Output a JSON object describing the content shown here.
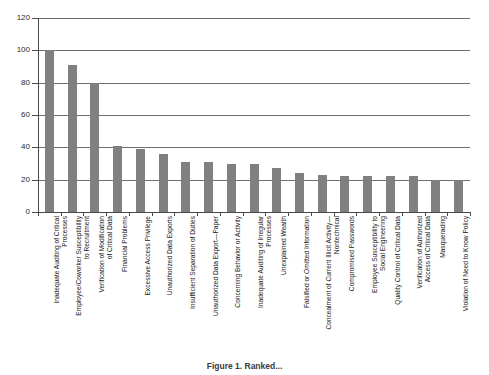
{
  "figure": {
    "caption": "Figure 1. Ranked...",
    "background_color": "#ffffff",
    "bar_color": "#808080",
    "axis_color": "#4a4a4a",
    "grid_color": "#6e6e6e"
  },
  "chart_data": {
    "type": "bar",
    "title": "",
    "subtitle": "",
    "xlabel": "",
    "ylabel": "",
    "ylim": [
      0,
      120
    ],
    "yticks": [
      0,
      20,
      40,
      60,
      80,
      100,
      120
    ],
    "ytick_labels": [
      "0",
      "20",
      "40",
      "60",
      "80",
      "100",
      "120"
    ],
    "grid": true,
    "grid_axis": "y",
    "legend": false,
    "legend_position": "none",
    "orientation": "vertical",
    "categories": [
      "Inadequate Auditing of Critical\nProcesses",
      "Employee/Coworker Susceptibility\nto Recruitment",
      "Verification of Modification\nof Critical Data",
      "Financial Problems",
      "Excessive Access Privilege",
      "Unauthorized Data Exports",
      "Insufficient Separation of Duties",
      "Unauthorized Data Export—Paper",
      "Concerning Behavior or Activity",
      "Inadequate Auditing of Irregular\nProcesses",
      "Unexplained Wealth",
      "Falsified or Omitted Information",
      "Concealment of Current Illicit Activity—\nNontechnical",
      "Compromised Passwords",
      "Employee Susceptibility to\nSocial Engineering",
      "Quality Control of Critical Data",
      "Verification of Authorized\nAccess of Critical Data",
      "Masquerading",
      "Violation of Need to Know Policy"
    ],
    "values": [
      100,
      91,
      80,
      41,
      39,
      36,
      31,
      31,
      30,
      30,
      27,
      24,
      23,
      22,
      22,
      22,
      22,
      20,
      20
    ],
    "series": [
      {
        "name": "Count",
        "values": [
          100,
          91,
          80,
          41,
          39,
          36,
          31,
          31,
          30,
          30,
          27,
          24,
          23,
          22,
          22,
          22,
          22,
          20,
          20
        ]
      }
    ]
  }
}
